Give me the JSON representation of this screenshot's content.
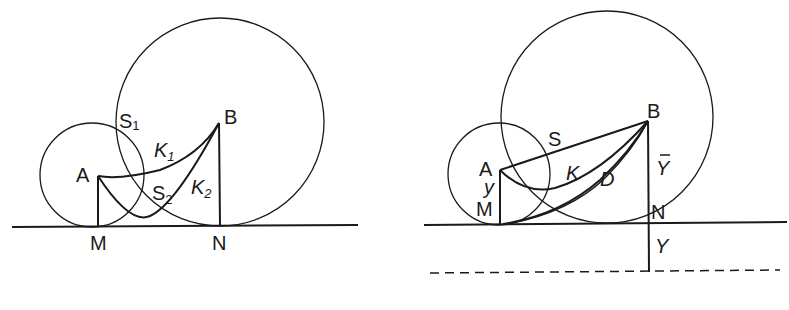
{
  "figures": [
    {
      "id": "left",
      "labels": {
        "A": "A",
        "B": "B",
        "M": "M",
        "N": "N",
        "S1": "S",
        "S1_sub": "1",
        "S2": "S",
        "S2_sub": "2",
        "K1": "K",
        "K1_sub": "1",
        "K2": "K",
        "K2_sub": "2"
      }
    },
    {
      "id": "right",
      "labels": {
        "A": "A",
        "B": "B",
        "M": "M",
        "N": "N",
        "S": "S",
        "K": "K",
        "D": "D",
        "y": "y",
        "Ybar": "Y",
        "Y": "Y"
      }
    }
  ],
  "colors": {
    "ink": "#1a1a1a",
    "background": "#ffffff"
  }
}
